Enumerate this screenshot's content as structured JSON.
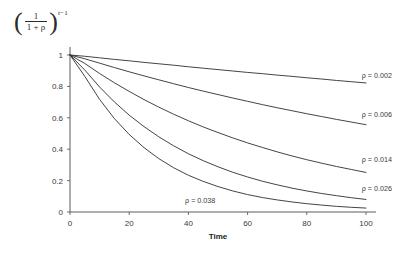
{
  "figure": {
    "y_axis_formula": {
      "open_paren": "(",
      "numerator": "1",
      "denominator": "1 + ρ",
      "close_paren": ")",
      "exponent": "t−1",
      "plain": "(1/(1+ρ))^(t-1)"
    },
    "background_color": "#ffffff",
    "line_color": "#2f2f2f",
    "axis_color": "#4a4a4a"
  },
  "chart_data": {
    "type": "line",
    "title": "",
    "subtitle": "",
    "xlabel": "Time",
    "ylabel": "(1/(1+ρ))^(t-1)",
    "xlim": [
      0,
      100
    ],
    "ylim": [
      0,
      1
    ],
    "xticks": [
      0,
      20,
      40,
      60,
      80,
      100
    ],
    "xtick_labels": [
      "0",
      "20",
      "40",
      "60",
      "80",
      "100"
    ],
    "yticks": [
      0,
      0.2,
      0.4,
      0.6,
      0.8,
      1
    ],
    "ytick_labels": [
      "0",
      "0.2",
      "0.4",
      "0.6",
      "0.8",
      "1"
    ],
    "grid": false,
    "legend_position": "inline-right-of-curve",
    "x": [
      0,
      5,
      10,
      15,
      20,
      25,
      30,
      35,
      40,
      45,
      50,
      55,
      60,
      65,
      70,
      75,
      80,
      85,
      90,
      95,
      100
    ],
    "series": [
      {
        "name": "ρ = 0.002",
        "rho": 0.002,
        "label": "ρ = 0.002",
        "label_x": 100,
        "label_y": 0.875,
        "values": [
          1.0,
          0.992,
          0.982,
          0.972,
          0.963,
          0.953,
          0.944,
          0.935,
          0.925,
          0.916,
          0.907,
          0.898,
          0.889,
          0.881,
          0.872,
          0.864,
          0.855,
          0.847,
          0.838,
          0.83,
          0.822
        ]
      },
      {
        "name": "ρ = 0.006",
        "rho": 0.006,
        "label": "ρ = 0.006",
        "label_x": 100,
        "label_y": 0.625,
        "values": [
          1.0,
          0.976,
          0.948,
          0.92,
          0.893,
          0.867,
          0.842,
          0.817,
          0.793,
          0.77,
          0.748,
          0.726,
          0.705,
          0.684,
          0.664,
          0.645,
          0.626,
          0.608,
          0.59,
          0.573,
          0.556
        ]
      },
      {
        "name": "ρ = 0.014",
        "rho": 0.014,
        "label": "ρ = 0.014",
        "label_x": 100,
        "label_y": 0.34,
        "values": [
          1.0,
          0.946,
          0.882,
          0.823,
          0.768,
          0.716,
          0.668,
          0.623,
          0.581,
          0.542,
          0.506,
          0.472,
          0.44,
          0.411,
          0.383,
          0.357,
          0.333,
          0.311,
          0.29,
          0.271,
          0.252
        ]
      },
      {
        "name": "ρ = 0.026",
        "rho": 0.026,
        "label": "ρ = 0.026",
        "label_x": 100,
        "label_y": 0.155,
        "values": [
          1.0,
          0.904,
          0.796,
          0.701,
          0.617,
          0.544,
          0.479,
          0.422,
          0.371,
          0.327,
          0.288,
          0.253,
          0.223,
          0.196,
          0.173,
          0.152,
          0.134,
          0.118,
          0.104,
          0.091,
          0.08
        ]
      },
      {
        "name": "ρ = 0.038",
        "rho": 0.038,
        "label": "ρ = 0.038",
        "label_x": 44,
        "label_y": 0.075,
        "values": [
          1.0,
          0.864,
          0.717,
          0.595,
          0.494,
          0.41,
          0.34,
          0.282,
          0.234,
          0.195,
          0.162,
          0.134,
          0.111,
          0.092,
          0.077,
          0.064,
          0.053,
          0.044,
          0.036,
          0.03,
          0.025
        ]
      }
    ]
  }
}
